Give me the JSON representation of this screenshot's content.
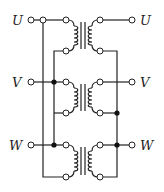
{
  "diagram": {
    "type": "three-phase transformer circuit",
    "phases": [
      {
        "label_left": "U",
        "label_right": "U",
        "y_top": 20,
        "y_bottom": 51
      },
      {
        "label_left": "V",
        "label_right": "V",
        "y_top": 82,
        "y_bottom": 113
      },
      {
        "label_left": "W",
        "label_right": "W",
        "y_top": 145,
        "y_bottom": 177
      }
    ],
    "colors": {
      "line": "#222222",
      "background": "#ffffff"
    }
  }
}
